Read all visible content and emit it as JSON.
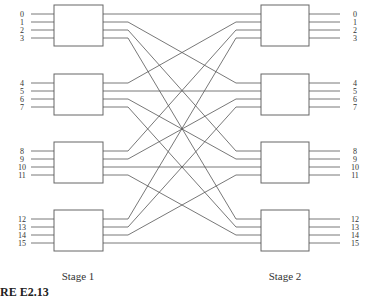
{
  "diagram": {
    "stage1_label": "Stage 1",
    "stage2_label": "Stage 2",
    "caption": "RE E2.13",
    "input_labels": [
      "0",
      "1",
      "2",
      "3",
      "4",
      "5",
      "6",
      "7",
      "8",
      "9",
      "10",
      "11",
      "12",
      "13",
      "14",
      "15"
    ],
    "output_labels": [
      "0",
      "1",
      "2",
      "3",
      "4",
      "5",
      "6",
      "7",
      "8",
      "9",
      "10",
      "11",
      "12",
      "13",
      "14",
      "15"
    ],
    "boxes_per_stage": 4,
    "ports_per_box": 4,
    "wiring": "stage1 box i output j -> stage2 box j input i",
    "line_color": "#555555",
    "box_stroke": "#666666"
  }
}
